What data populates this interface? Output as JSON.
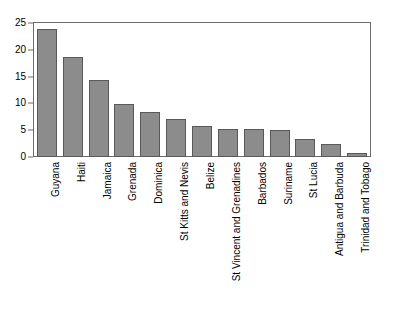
{
  "chart_data": {
    "type": "bar",
    "title": "",
    "subtitle": "",
    "xlabel": "",
    "ylabel": "",
    "ylim": [
      0,
      25
    ],
    "yticks": [
      0,
      5,
      10,
      15,
      20,
      25
    ],
    "ytick_labels": [
      "0",
      "5",
      "10",
      "15",
      "20",
      "25"
    ],
    "grid": false,
    "legend": false,
    "orientation": "vertical",
    "bar_color": "#8c8c8c",
    "bar_edge_color": "#595959",
    "frame_color": "#6b6b6b",
    "categories": [
      "Guyana",
      "Haiti",
      "Jamaica",
      "Grenada",
      "Dominica",
      "St Kitts and Nevis",
      "Belize",
      "St Vincent and Grenadines",
      "Barbados",
      "Suriname",
      "St Lucia",
      "Antigua and Barbuda",
      "Trinidad and Tobago"
    ],
    "values": [
      23.8,
      18.7,
      14.4,
      9.8,
      8.4,
      7.1,
      5.8,
      5.2,
      5.2,
      5.1,
      3.4,
      2.4,
      0.7
    ]
  }
}
